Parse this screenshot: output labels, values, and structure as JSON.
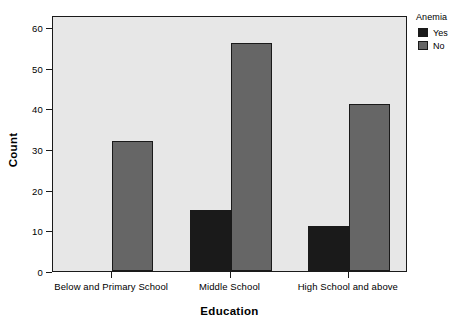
{
  "chart_data": {
    "type": "bar",
    "title": "",
    "xlabel": "Education",
    "ylabel": "Count",
    "categories": [
      "Below and Primary School",
      "Middle School",
      "High School and above"
    ],
    "series": [
      {
        "name": "Yes",
        "values": [
          0,
          15,
          11
        ],
        "color": "#1a1a1a"
      },
      {
        "name": "No",
        "values": [
          32,
          56,
          41
        ],
        "color": "#666666"
      }
    ],
    "ylim": [
      0,
      63
    ],
    "yticks": [
      0,
      10,
      20,
      30,
      40,
      50,
      60
    ],
    "ytick_labels": [
      "0",
      "10",
      "20",
      "30",
      "40",
      "50",
      "60"
    ],
    "grid": false,
    "legend": {
      "title": "Anemia",
      "position": "right-outside",
      "entries": [
        {
          "label": "Yes",
          "color": "#1a1a1a"
        },
        {
          "label": "No",
          "color": "#666666"
        }
      ]
    },
    "panel_background": "#e7e7e7",
    "frame_color": "#1a1a1a"
  }
}
